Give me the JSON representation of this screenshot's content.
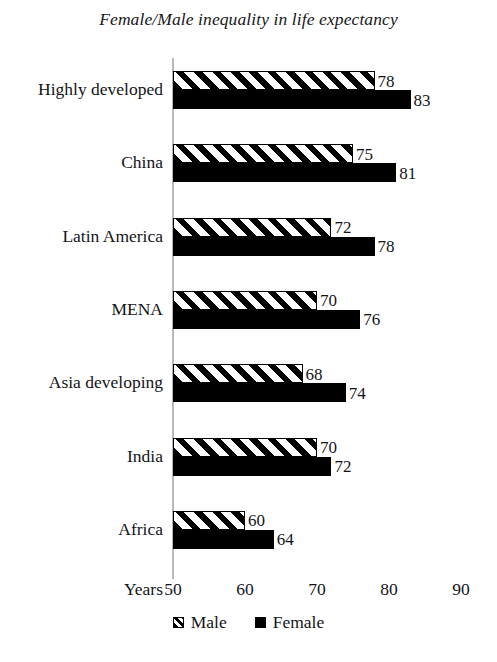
{
  "chart_data": {
    "type": "bar",
    "orientation": "horizontal",
    "title": "Female/Male inequality in life expectancy",
    "xlabel": "Years",
    "ylabel": "",
    "xlim": [
      50,
      90
    ],
    "xticks": [
      50,
      60,
      70,
      80,
      90
    ],
    "grid": false,
    "legend_position": "bottom",
    "categories": [
      "Highly developed",
      "China",
      "Latin America",
      "MENA",
      "Asia developing",
      "India",
      "Africa"
    ],
    "series": [
      {
        "name": "Male",
        "style": "hatched",
        "color": "#000000",
        "values": [
          78,
          75,
          72,
          70,
          68,
          70,
          60
        ]
      },
      {
        "name": "Female",
        "style": "solid",
        "color": "#000000",
        "values": [
          83,
          81,
          78,
          76,
          74,
          72,
          64
        ]
      }
    ]
  },
  "axis": {
    "name": "Years",
    "ticks": [
      "50",
      "60",
      "70",
      "80",
      "90"
    ]
  },
  "legend": {
    "items": [
      {
        "label": "Male",
        "style": "hatched"
      },
      {
        "label": "Female",
        "style": "solid"
      }
    ]
  }
}
